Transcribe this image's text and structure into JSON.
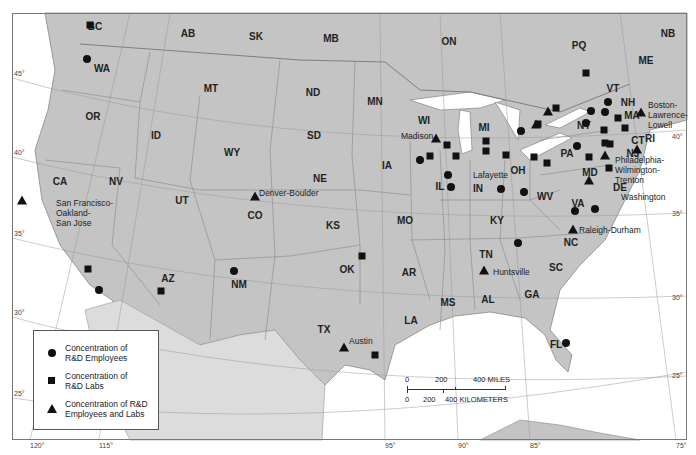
{
  "regions": [
    {
      "id": "BC",
      "x": 95,
      "y": 26
    },
    {
      "id": "AB",
      "x": 188,
      "y": 33
    },
    {
      "id": "SK",
      "x": 256,
      "y": 36
    },
    {
      "id": "MB",
      "x": 331,
      "y": 38
    },
    {
      "id": "ON",
      "x": 449,
      "y": 41
    },
    {
      "id": "PQ",
      "x": 579,
      "y": 45
    },
    {
      "id": "NB",
      "x": 668,
      "y": 33
    },
    {
      "id": "ME",
      "x": 646,
      "y": 60
    },
    {
      "id": "WA",
      "x": 102,
      "y": 68
    },
    {
      "id": "MT",
      "x": 211,
      "y": 88
    },
    {
      "id": "ND",
      "x": 313,
      "y": 92
    },
    {
      "id": "MN",
      "x": 375,
      "y": 101
    },
    {
      "id": "OR",
      "x": 93,
      "y": 116
    },
    {
      "id": "ID",
      "x": 156,
      "y": 135
    },
    {
      "id": "SD",
      "x": 314,
      "y": 135
    },
    {
      "id": "WI",
      "x": 424,
      "y": 120
    },
    {
      "id": "MI",
      "x": 484,
      "y": 127
    },
    {
      "id": "NY",
      "x": 584,
      "y": 125
    },
    {
      "id": "VT",
      "x": 613,
      "y": 88
    },
    {
      "id": "NH",
      "x": 628,
      "y": 102
    },
    {
      "id": "MA",
      "x": 632,
      "y": 115
    },
    {
      "id": "CT",
      "x": 638,
      "y": 140
    },
    {
      "id": "RI",
      "x": 650,
      "y": 138
    },
    {
      "id": "NJ",
      "x": 633,
      "y": 153
    },
    {
      "id": "WY",
      "x": 232,
      "y": 152
    },
    {
      "id": "NE",
      "x": 320,
      "y": 178
    },
    {
      "id": "IA",
      "x": 387,
      "y": 165
    },
    {
      "id": "IL",
      "x": 440,
      "y": 186
    },
    {
      "id": "IN",
      "x": 478,
      "y": 188
    },
    {
      "id": "OH",
      "x": 518,
      "y": 170
    },
    {
      "id": "PA",
      "x": 567,
      "y": 153
    },
    {
      "id": "MD",
      "x": 590,
      "y": 172
    },
    {
      "id": "DE",
      "x": 620,
      "y": 187
    },
    {
      "id": "CA",
      "x": 60,
      "y": 181
    },
    {
      "id": "NV",
      "x": 116,
      "y": 181
    },
    {
      "id": "UT",
      "x": 182,
      "y": 200
    },
    {
      "id": "CO",
      "x": 255,
      "y": 215
    },
    {
      "id": "KS",
      "x": 333,
      "y": 225
    },
    {
      "id": "MO",
      "x": 405,
      "y": 220
    },
    {
      "id": "KY",
      "x": 497,
      "y": 220
    },
    {
      "id": "WV",
      "x": 545,
      "y": 196
    },
    {
      "id": "VA",
      "x": 578,
      "y": 203
    },
    {
      "id": "NC",
      "x": 571,
      "y": 242
    },
    {
      "id": "TN",
      "x": 486,
      "y": 254
    },
    {
      "id": "AZ",
      "x": 168,
      "y": 278
    },
    {
      "id": "NM",
      "x": 239,
      "y": 284
    },
    {
      "id": "OK",
      "x": 347,
      "y": 269
    },
    {
      "id": "AR",
      "x": 409,
      "y": 272
    },
    {
      "id": "SC",
      "x": 556,
      "y": 267
    },
    {
      "id": "MS",
      "x": 448,
      "y": 302
    },
    {
      "id": "AL",
      "x": 488,
      "y": 299
    },
    {
      "id": "GA",
      "x": 532,
      "y": 294
    },
    {
      "id": "LA",
      "x": 411,
      "y": 320
    },
    {
      "id": "TX",
      "x": 324,
      "y": 329
    },
    {
      "id": "FL",
      "x": 556,
      "y": 344
    }
  ],
  "cities": [
    {
      "name": "San Francisco-\nOakland-\nSan Jose",
      "x": 56,
      "y": 198
    },
    {
      "name": "Denver-Boulder",
      "x": 259,
      "y": 188
    },
    {
      "name": "Madison",
      "x": 401,
      "y": 131
    },
    {
      "name": "Lafayette",
      "x": 473,
      "y": 170
    },
    {
      "name": "Huntsville",
      "x": 493,
      "y": 267
    },
    {
      "name": "Austin",
      "x": 349,
      "y": 336
    },
    {
      "name": "Raleigh-Durham",
      "x": 579,
      "y": 225
    },
    {
      "name": "Boston-\nLawrence-\nLowell",
      "x": 648,
      "y": 100
    },
    {
      "name": "Philadelphia-\nWilmington-\nTrenton",
      "x": 615,
      "y": 155
    },
    {
      "name": "Washington",
      "x": 621,
      "y": 192
    }
  ],
  "markers": {
    "circles": [
      [
        87,
        59
      ],
      [
        99,
        290
      ],
      [
        234,
        271
      ],
      [
        420,
        160
      ],
      [
        448,
        175
      ],
      [
        451,
        187
      ],
      [
        501,
        189
      ],
      [
        521,
        131
      ],
      [
        524,
        192
      ],
      [
        575,
        211
      ],
      [
        577,
        146
      ],
      [
        586,
        123
      ],
      [
        591,
        111
      ],
      [
        605,
        112
      ],
      [
        608,
        102
      ],
      [
        595,
        209
      ],
      [
        566,
        343
      ],
      [
        518,
        243
      ]
    ],
    "squares": [
      [
        90,
        25
      ],
      [
        88,
        269
      ],
      [
        161,
        291
      ],
      [
        362,
        256
      ],
      [
        375,
        355
      ],
      [
        430,
        156
      ],
      [
        447,
        145
      ],
      [
        456,
        156
      ],
      [
        486,
        141
      ],
      [
        486,
        151
      ],
      [
        506,
        155
      ],
      [
        538,
        124
      ],
      [
        556,
        108
      ],
      [
        586,
        73
      ],
      [
        534,
        157
      ],
      [
        547,
        163
      ],
      [
        589,
        157
      ],
      [
        604,
        130
      ],
      [
        605,
        143
      ],
      [
        618,
        118
      ],
      [
        625,
        128
      ],
      [
        609,
        168
      ],
      [
        610,
        144
      ]
    ],
    "triangles": [
      [
        22,
        200
      ],
      [
        255,
        196
      ],
      [
        344,
        347
      ],
      [
        484,
        270
      ],
      [
        573,
        229
      ],
      [
        436,
        138
      ],
      [
        536,
        124
      ],
      [
        548,
        111
      ],
      [
        605,
        155
      ],
      [
        589,
        180
      ],
      [
        641,
        112
      ],
      [
        637,
        149
      ]
    ]
  },
  "legend": {
    "items": [
      {
        "symbol": "circle",
        "label_line1": "Concentration of",
        "label_line2": "R&D Employees"
      },
      {
        "symbol": "square",
        "label_line1": "Concentration of",
        "label_line2": "R&D Labs"
      },
      {
        "symbol": "triangle",
        "label_line1": "Concentration of R&D",
        "label_line2": "Employees and Labs"
      }
    ]
  },
  "scale": {
    "miles_ticks": [
      "0",
      "200",
      "400 MILES"
    ],
    "km_ticks": [
      "0",
      "200",
      "400 KILOMETERS"
    ]
  },
  "graticule": {
    "longitudes": [
      {
        "label": "120°",
        "x": 30
      },
      {
        "label": "115°",
        "x": 99
      },
      {
        "label": "95°",
        "x": 385
      },
      {
        "label": "90°",
        "x": 458
      },
      {
        "label": "85°",
        "x": 530
      },
      {
        "label": "75°",
        "x": 676
      }
    ],
    "latitudes": [
      {
        "label": "45°",
        "x": 14,
        "y": 78
      },
      {
        "label": "40°",
        "x": 14,
        "y": 157
      },
      {
        "label": "35°",
        "x": 14,
        "y": 238
      },
      {
        "label": "30°",
        "x": 14,
        "y": 317
      },
      {
        "label": "25°",
        "x": 14,
        "y": 398
      },
      {
        "label": "40°",
        "x": 672,
        "y": 141
      },
      {
        "label": "35°",
        "x": 672,
        "y": 218
      },
      {
        "label": "30°",
        "x": 672,
        "y": 302
      },
      {
        "label": "25°",
        "x": 672,
        "y": 380
      }
    ]
  },
  "colors": {
    "land": "#c8c8c8",
    "us_land": "#bdbdbd",
    "water": "#ffffff",
    "border": "#777777",
    "marker": "#111111"
  }
}
